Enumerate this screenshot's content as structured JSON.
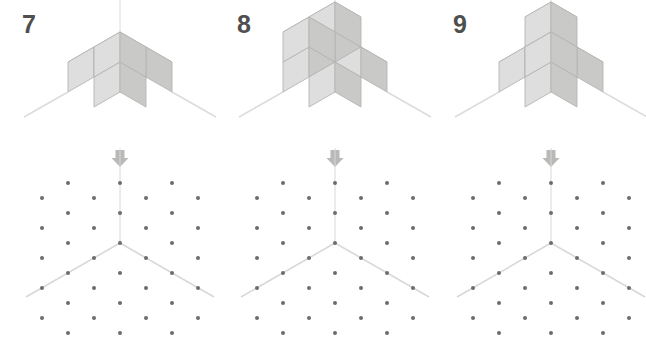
{
  "page": {
    "width": 646,
    "height": 348,
    "background": "#ffffff"
  },
  "style": {
    "cube_top_face": "#e9e9e7",
    "cube_left_face": "#dedede",
    "cube_right_face": "#c9c9c7",
    "cube_edge": "#b4b4b2",
    "axis_line": "#dcdcda",
    "dot_color": "#6b6b72",
    "arrow_color": "#b9b9b7",
    "number_color": "#4f4f4f",
    "grid_axis_line": "#d8d8d6"
  },
  "geometry": {
    "cube_size": 30,
    "iso_dx": 26,
    "iso_dy": 15,
    "dot_radius": 2,
    "grid_step_x": 26,
    "grid_step_y": 15,
    "grid_origin_x": 120,
    "grid_origin_y": 65
  },
  "panels": [
    {
      "number": "7",
      "origin": {
        "x": 120,
        "y": 122
      },
      "arrow": {
        "label": "down-arrow",
        "x": 120
      },
      "cubes": [
        {
          "x": 0,
          "y": 0,
          "z": 0
        },
        {
          "x": 1,
          "y": 0,
          "z": 0
        },
        {
          "x": 0,
          "y": 1,
          "z": 0
        },
        {
          "x": 0,
          "y": 0,
          "z": 1
        }
      ],
      "cube_count": 4,
      "grid": {
        "origin": {
          "x": 120,
          "y": 65
        },
        "axes": [
          {
            "name": "vertical-axis",
            "dx": 0,
            "dy": -1,
            "length": 3
          },
          {
            "name": "left-axis",
            "dx": -1,
            "dy": 0,
            "length": 3
          },
          {
            "name": "right-axis",
            "dx": 1,
            "dy": 0,
            "length": 3
          }
        ]
      }
    },
    {
      "number": "8",
      "origin": {
        "x": 120,
        "y": 122
      },
      "arrow": {
        "label": "down-arrow",
        "x": 120
      },
      "cubes": [
        {
          "x": 0,
          "y": 0,
          "z": 0
        },
        {
          "x": 1,
          "y": 0,
          "z": 0
        },
        {
          "x": 0,
          "y": 1,
          "z": 0
        },
        {
          "x": 1,
          "y": 1,
          "z": 0
        },
        {
          "x": 0,
          "y": 1,
          "z": 1
        },
        {
          "x": 1,
          "y": 1,
          "z": 1
        }
      ],
      "cube_count": 6,
      "grid": {
        "origin": {
          "x": 120,
          "y": 65
        },
        "axes": [
          {
            "name": "vertical-axis",
            "dx": 0,
            "dy": -1,
            "length": 3
          },
          {
            "name": "left-axis",
            "dx": -1,
            "dy": 0,
            "length": 3
          },
          {
            "name": "right-axis",
            "dx": 1,
            "dy": 0,
            "length": 3
          }
        ]
      }
    },
    {
      "number": "9",
      "origin": {
        "x": 120,
        "y": 122
      },
      "arrow": {
        "label": "down-arrow",
        "x": 120
      },
      "cubes": [
        {
          "x": 0,
          "y": 0,
          "z": 0
        },
        {
          "x": 1,
          "y": 0,
          "z": 0
        },
        {
          "x": 0,
          "y": 1,
          "z": 0
        },
        {
          "x": 1,
          "y": 1,
          "z": 0
        },
        {
          "x": 0,
          "y": 0,
          "z": 1
        },
        {
          "x": 1,
          "y": 1,
          "z": 1
        }
      ],
      "cube_count": 6,
      "grid": {
        "origin": {
          "x": 120,
          "y": 65
        },
        "axes": [
          {
            "name": "vertical-axis",
            "dx": 0,
            "dy": -1,
            "length": 3
          },
          {
            "name": "left-axis",
            "dx": -1,
            "dy": 0,
            "length": 3
          },
          {
            "name": "right-axis",
            "dx": 1,
            "dy": 0,
            "length": 3
          }
        ]
      }
    }
  ]
}
